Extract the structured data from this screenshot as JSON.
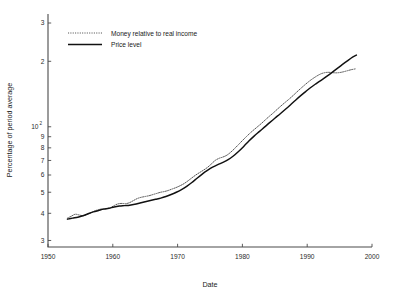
{
  "chart_data": {
    "type": "line",
    "title": "",
    "xlabel": "Date",
    "ylabel": "Percentage of period average",
    "xlim": [
      1950,
      2000
    ],
    "ylim": [
      28,
      330
    ],
    "yscale": "log",
    "xscale": "linear",
    "grid": false,
    "legend_position": "top-left",
    "x_ticks": [
      1950,
      1960,
      1970,
      1980,
      1990,
      2000
    ],
    "x_tick_labels": [
      "1950",
      "1960",
      "1970",
      "1980",
      "1990",
      "2000"
    ],
    "y_ticks": [
      30,
      40,
      50,
      60,
      70,
      80,
      90,
      100,
      200,
      300
    ],
    "y_tick_labels": [
      "3",
      "4",
      "5",
      "6",
      "7",
      "8",
      "9",
      "10^2",
      "2",
      "3"
    ],
    "y_tick_label_main": [
      "3",
      "4",
      "5",
      "6",
      "7",
      "8",
      "9",
      "10",
      "2",
      "3"
    ],
    "y_tick_label_exponent": [
      "",
      "",
      "",
      "",
      "",
      "",
      "",
      "2",
      "",
      ""
    ],
    "series": [
      {
        "name": "Money relative to real income",
        "style": "dotted",
        "color": "#555555",
        "x": [
          1953.0,
          1953.6,
          1954.2,
          1954.8,
          1955.4,
          1956.0,
          1956.6,
          1957.2,
          1957.8,
          1958.4,
          1959.0,
          1959.6,
          1960.2,
          1960.8,
          1961.4,
          1962.0,
          1962.6,
          1963.2,
          1963.8,
          1964.4,
          1965.0,
          1965.6,
          1966.2,
          1966.8,
          1967.4,
          1968.0,
          1968.6,
          1969.2,
          1969.8,
          1970.4,
          1971.0,
          1971.6,
          1972.2,
          1972.8,
          1973.4,
          1974.0,
          1974.6,
          1975.2,
          1975.8,
          1976.4,
          1977.0,
          1977.6,
          1978.2,
          1978.8,
          1979.4,
          1980.0,
          1980.6,
          1981.2,
          1981.8,
          1982.4,
          1983.0,
          1983.6,
          1984.2,
          1984.8,
          1985.4,
          1986.0,
          1986.6,
          1987.2,
          1987.8,
          1988.4,
          1989.0,
          1989.6,
          1990.2,
          1990.8,
          1991.4,
          1992.0,
          1992.6,
          1993.2,
          1993.8,
          1994.4,
          1995.0,
          1995.6,
          1996.2,
          1996.8,
          1997.4
        ],
        "y": [
          38.0,
          38.8,
          39.6,
          39.3,
          39.0,
          39.5,
          40.2,
          41.0,
          41.6,
          41.9,
          42.0,
          42.4,
          43.4,
          44.2,
          44.4,
          44.3,
          44.8,
          45.8,
          46.8,
          47.4,
          47.8,
          48.2,
          48.8,
          49.4,
          50.0,
          50.4,
          51.0,
          51.8,
          52.6,
          53.6,
          54.8,
          56.4,
          58.2,
          60.0,
          61.6,
          63.2,
          65.0,
          67.4,
          70.0,
          71.6,
          72.6,
          74.0,
          76.4,
          79.4,
          82.8,
          86.4,
          90.0,
          93.6,
          97.0,
          100.4,
          104.0,
          108.0,
          112.0,
          116.0,
          120.5,
          125.0,
          129.5,
          134.0,
          139.0,
          144.5,
          150.0,
          155.5,
          161.0,
          166.0,
          170.5,
          174.5,
          177.0,
          178.0,
          177.5,
          177.0,
          177.5,
          179.0,
          181.0,
          183.0,
          184.5
        ]
      },
      {
        "name": "Price level",
        "style": "solid",
        "color": "#111111",
        "x": [
          1953.0,
          1953.8,
          1954.6,
          1955.4,
          1956.2,
          1957.0,
          1957.8,
          1958.6,
          1959.4,
          1960.2,
          1961.0,
          1961.8,
          1962.6,
          1963.4,
          1964.2,
          1965.0,
          1965.8,
          1966.6,
          1967.4,
          1968.2,
          1969.0,
          1969.8,
          1970.6,
          1971.4,
          1972.2,
          1973.0,
          1973.8,
          1974.6,
          1975.4,
          1976.2,
          1977.0,
          1977.8,
          1978.6,
          1979.4,
          1980.2,
          1981.0,
          1981.8,
          1982.6,
          1983.4,
          1984.2,
          1985.0,
          1985.8,
          1986.6,
          1987.4,
          1988.2,
          1989.0,
          1989.8,
          1990.6,
          1991.4,
          1992.2,
          1993.0,
          1993.8,
          1994.6,
          1995.4,
          1996.2,
          1997.0,
          1997.6
        ],
        "y": [
          37.6,
          38.0,
          38.4,
          39.0,
          39.8,
          40.6,
          41.2,
          41.8,
          42.2,
          42.8,
          43.2,
          43.4,
          43.6,
          44.0,
          44.6,
          45.2,
          45.8,
          46.4,
          47.0,
          47.8,
          48.8,
          50.0,
          51.4,
          53.2,
          55.4,
          58.0,
          60.6,
          63.0,
          65.2,
          67.0,
          68.6,
          70.6,
          73.4,
          77.0,
          81.2,
          86.0,
          90.6,
          95.0,
          99.6,
          104.5,
          109.5,
          114.5,
          120.0,
          126.0,
          132.5,
          139.0,
          145.5,
          152.0,
          158.0,
          164.0,
          170.5,
          177.5,
          185.0,
          193.0,
          201.0,
          209.0,
          213.5
        ]
      }
    ],
    "annotations": []
  },
  "legend": {
    "items": [
      {
        "label": "Money relative to real income",
        "style": "dotted"
      },
      {
        "label": "Price level",
        "style": "solid"
      }
    ]
  }
}
